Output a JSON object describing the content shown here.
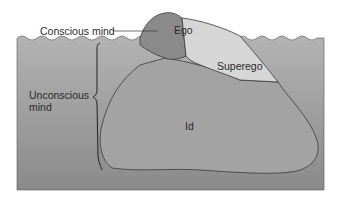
{
  "diagram": {
    "labels": {
      "conscious": "Conscious mind",
      "unconscious_line1": "Unconscious",
      "unconscious_line2": "mind",
      "ego": "Ego",
      "superego": "Superego",
      "id": "Id"
    },
    "colors": {
      "background": "#ffffff",
      "water": "#a9a9a9",
      "water_dark": "#8c8c8c",
      "ego": "#8a8a8a",
      "superego": "#d6d6d6",
      "id": "#9f9f9f",
      "outline": "#3a3a3a"
    }
  }
}
